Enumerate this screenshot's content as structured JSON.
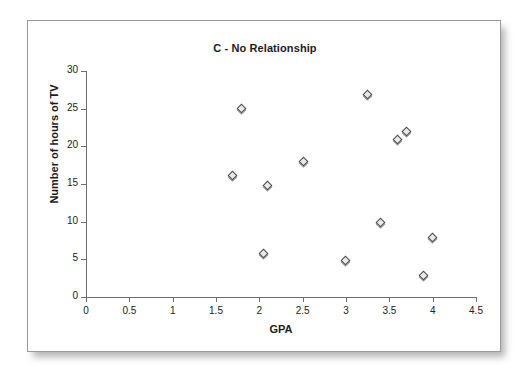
{
  "figure": {
    "title": "C - No Relationship",
    "frame_color": "#9a9a9a",
    "background": "#ffffff"
  },
  "chart_data": {
    "type": "scatter",
    "title": "C - No Relationship",
    "xlabel": "GPA",
    "ylabel": "Number of hours of TV",
    "xlim": [
      0,
      4.5
    ],
    "ylim": [
      0,
      30
    ],
    "xticks": [
      0,
      0.5,
      1,
      1.5,
      2,
      2.5,
      3,
      3.5,
      4,
      4.5
    ],
    "xtick_labels": [
      "0",
      "0.5",
      "1",
      "1.5",
      "2",
      "2.5",
      "3",
      "3.5",
      "4",
      "4.5"
    ],
    "yticks": [
      0,
      5,
      10,
      15,
      20,
      25,
      30
    ],
    "ytick_labels": [
      "0",
      "5",
      "10",
      "15",
      "20",
      "25",
      "30"
    ],
    "grid": false,
    "legend": false,
    "marker": "diamond",
    "marker_fill": "#e9e9e9",
    "marker_edge": "#4a4a4a",
    "points": [
      {
        "x": 1.7,
        "y": 16.0
      },
      {
        "x": 1.8,
        "y": 24.9
      },
      {
        "x": 2.05,
        "y": 5.7
      },
      {
        "x": 2.1,
        "y": 14.8
      },
      {
        "x": 2.51,
        "y": 17.9
      },
      {
        "x": 3.0,
        "y": 4.8
      },
      {
        "x": 3.25,
        "y": 26.8
      },
      {
        "x": 3.4,
        "y": 9.8
      },
      {
        "x": 3.6,
        "y": 20.8
      },
      {
        "x": 3.7,
        "y": 21.9
      },
      {
        "x": 3.9,
        "y": 2.8
      },
      {
        "x": 4.0,
        "y": 7.8
      }
    ]
  }
}
